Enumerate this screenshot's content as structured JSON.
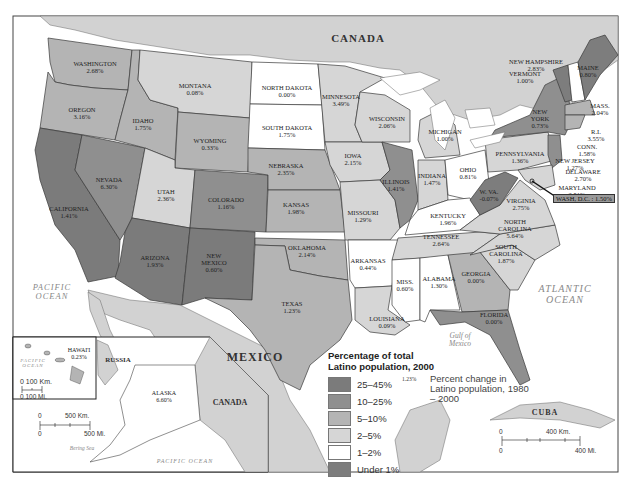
{
  "map": {
    "title": "Percentage of total Latino population, 2000",
    "colors": {
      "25-45": "#7b7b7b",
      "10-25": "#8f8f8f",
      "5-10": "#b4b4b4",
      "2-5": "#d6d6d6",
      "1-2": "#ffffff",
      "under1": "#7d7d7d",
      "water": "#ffffff",
      "land_foreign": "#d2d2d2",
      "border": "#3a3a3a"
    },
    "countries": {
      "canada": "CANADA",
      "mexico": "MEXICO",
      "russia": "RUSSIA",
      "canada_inset": "CANADA",
      "cuba": "CUBA"
    },
    "oceans": {
      "pacific": "PACIFIC OCEAN",
      "atlantic": "ATLANTIC OCEAN",
      "gulf": "Gulf of Mexico",
      "pacific_hawaii": "PACIFIC OCEAN",
      "pacific_alaska": "PACIFIC OCEAN",
      "bering": "Bering Sea"
    },
    "states": [
      {
        "name": "WASHINGTON",
        "change": "2.68%",
        "category": "5-10"
      },
      {
        "name": "OREGON",
        "change": "3.16%",
        "category": "5-10"
      },
      {
        "name": "CALIFORNIA",
        "change": "1.41%",
        "category": "25-45"
      },
      {
        "name": "NEVADA",
        "change": "6.30%",
        "category": "10-25"
      },
      {
        "name": "IDAHO",
        "change": "1.75%",
        "category": "5-10"
      },
      {
        "name": "MONTANA",
        "change": "0.08%",
        "category": "2-5"
      },
      {
        "name": "WYOMING",
        "change": "0.33%",
        "category": "5-10"
      },
      {
        "name": "UTAH",
        "change": "2.36%",
        "category": "5-10"
      },
      {
        "name": "COLORADO",
        "change": "1.16%",
        "category": "10-25"
      },
      {
        "name": "ARIZONA",
        "change": "1.93%",
        "category": "25-45"
      },
      {
        "name": "NEW MEXICO",
        "change": "0.60%",
        "category": "25-45"
      },
      {
        "name": "NORTH DAKOTA",
        "change": "0.00%",
        "category": "1-2"
      },
      {
        "name": "SOUTH DAKOTA",
        "change": "1.75%",
        "category": "1-2"
      },
      {
        "name": "NEBRASKA",
        "change": "2.35%",
        "category": "5-10"
      },
      {
        "name": "KANSAS",
        "change": "1.98%",
        "category": "5-10"
      },
      {
        "name": "OKLAHOMA",
        "change": "2.14%",
        "category": "5-10"
      },
      {
        "name": "TEXAS",
        "change": "1.23%",
        "category": "25-45"
      },
      {
        "name": "MINNESOTA",
        "change": "3.49%",
        "category": "2-5"
      },
      {
        "name": "IOWA",
        "change": "2.15%",
        "category": "2-5"
      },
      {
        "name": "MISSOURI",
        "change": "1.29%",
        "category": "2-5"
      },
      {
        "name": "ARKANSAS",
        "change": "0.44%",
        "category": "2-5"
      },
      {
        "name": "LOUISIANA",
        "change": "0.09%",
        "category": "2-5"
      },
      {
        "name": "WISCONSIN",
        "change": "2.06%",
        "category": "2-5"
      },
      {
        "name": "ILLINOIS",
        "change": "1.41%",
        "category": "10-25"
      },
      {
        "name": "MICHIGAN",
        "change": "1.00%",
        "category": "2-5"
      },
      {
        "name": "INDIANA",
        "change": "1.47%",
        "category": "2-5"
      },
      {
        "name": "OHIO",
        "change": "0.81%",
        "category": "1-2"
      },
      {
        "name": "KENTUCKY",
        "change": "1.96%",
        "category": "1-2"
      },
      {
        "name": "TENNESSEE",
        "change": "2.64%",
        "category": "2-5"
      },
      {
        "name": "MISS.",
        "change": "0.60%",
        "category": "1-2"
      },
      {
        "name": "ALABAMA",
        "change": "1.30%",
        "category": "1-2"
      },
      {
        "name": "GEORGIA",
        "change": "0.00%",
        "category": "5-10"
      },
      {
        "name": "FLORIDA",
        "change": "0.00%",
        "category": "10-25"
      },
      {
        "name": "SOUTH CAROLINA",
        "change": "1.87%",
        "category": "2-5"
      },
      {
        "name": "NORTH CAROLINA",
        "change": "5.64%",
        "category": "2-5"
      },
      {
        "name": "VIRGINIA",
        "change": "2.75%",
        "category": "2-5"
      },
      {
        "name": "W. VA.",
        "change": "-0.07%",
        "category": "under1"
      },
      {
        "name": "PENNSYLVANIA",
        "change": "1.36%",
        "category": "2-5"
      },
      {
        "name": "NEW YORK",
        "change": "0.73%",
        "category": "10-25"
      },
      {
        "name": "VERMONT",
        "change": "1.00%",
        "category": "under1"
      },
      {
        "name": "NEW HAMPSHIRE",
        "change": "2.83%",
        "category": "1-2"
      },
      {
        "name": "MAINE",
        "change": "0.80%",
        "category": "under1"
      },
      {
        "name": "MASS.",
        "change": "2.04%",
        "category": "5-10"
      },
      {
        "name": "R.I.",
        "change": "3.55%",
        "category": "5-10"
      },
      {
        "name": "CONN.",
        "change": "1.58%",
        "category": "5-10"
      },
      {
        "name": "NEW JERSEY",
        "change": "1.27%",
        "category": "10-25"
      },
      {
        "name": "DELAWARE",
        "change": "2.70%",
        "category": "2-5"
      },
      {
        "name": "MARYLAND",
        "change": "2.51%",
        "category": "2-5"
      },
      {
        "name": "WASH, D.C.",
        "change": "1.50%",
        "category": "5-10"
      },
      {
        "name": "HAWAI'I",
        "change": "0.23%",
        "category": "5-10"
      },
      {
        "name": "ALASKA",
        "change": "6.60%",
        "category": "2-5"
      }
    ],
    "dc_label": "WASH, D.C. : 1.50%",
    "legend": {
      "title_line1": "Percentage of total",
      "title_line2": "Latino population, 2000",
      "items": [
        {
          "label": "25–45%",
          "color": "#7b7b7b"
        },
        {
          "label": "10–25%",
          "color": "#8f8f8f"
        },
        {
          "label": "5–10%",
          "color": "#b4b4b4"
        },
        {
          "label": "2–5%",
          "color": "#d6d6d6"
        },
        {
          "label": "1–2%",
          "color": "#ffffff"
        },
        {
          "label": "Under 1%",
          "color": "#7d7d7d"
        }
      ],
      "example_value": "1.23%",
      "example_text": "Percent change in Latino population, 1980 – 2000"
    },
    "scales": {
      "hawaii": {
        "km": "0  100 Km.",
        "mi": "0   100 Mi."
      },
      "alaska": {
        "km_zero": "0",
        "km": "500 Km.",
        "mi_zero": "0",
        "mi": "500 Mi."
      },
      "main": {
        "km_zero": "0",
        "km": "400 Km.",
        "mi_zero": "0",
        "mi": "400 Mi."
      }
    }
  }
}
